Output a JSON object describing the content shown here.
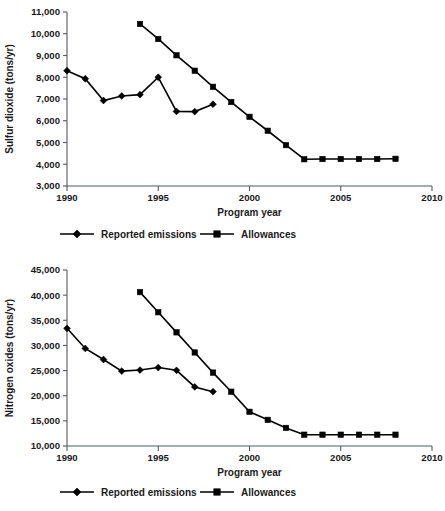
{
  "figure": {
    "background_color": "#ffffff",
    "ink_color": "#000000",
    "axis_color": "#555a5e"
  },
  "charts": [
    {
      "id": "sulfur-dioxide",
      "ylabel": "Sulfur dioxide (tons/yr)",
      "xlabel": "Program year",
      "legend": [
        {
          "label": "Reported emissions",
          "marker": "diamond"
        },
        {
          "label": "Allowances",
          "marker": "square"
        }
      ]
    },
    {
      "id": "nitrogen-oxides",
      "ylabel": "Nitrogen oxides (tons/yr)",
      "xlabel": "Program year",
      "legend": [
        {
          "label": "Reported emissions",
          "marker": "diamond"
        },
        {
          "label": "Allowances",
          "marker": "square"
        }
      ]
    }
  ],
  "chart_data": [
    {
      "type": "line",
      "id": "sulfur-dioxide",
      "title": "",
      "xlabel": "Program year",
      "ylabel": "Sulfur dioxide (tons/yr)",
      "xlim": [
        1990,
        2010
      ],
      "ylim": [
        3000,
        11000
      ],
      "xticks": [
        1990,
        1995,
        2000,
        2005,
        2010
      ],
      "xtick_labels": [
        "1990",
        "1995",
        "2000",
        "2005",
        "2010"
      ],
      "yticks": [
        3000,
        4000,
        5000,
        6000,
        7000,
        8000,
        9000,
        10000,
        11000
      ],
      "ytick_labels": [
        "3,000",
        "4,000",
        "5,000",
        "6,000",
        "7,000",
        "8,000",
        "9,000",
        "10,000",
        "11,000"
      ],
      "grid": false,
      "legend_position": "below",
      "series": [
        {
          "name": "Reported emissions",
          "marker": "diamond",
          "x": [
            1990,
            1991,
            1992,
            1993,
            1994,
            1995,
            1996,
            1997,
            1998
          ],
          "values": [
            8300,
            7930,
            6930,
            7140,
            7200,
            8000,
            6430,
            6420,
            6760
          ]
        },
        {
          "name": "Allowances",
          "marker": "square",
          "x": [
            1994,
            1995,
            1996,
            1997,
            1998,
            1999,
            2000,
            2001,
            2002,
            2003,
            2004,
            2005,
            2006,
            2007,
            2008
          ],
          "values": [
            10450,
            9760,
            9010,
            8300,
            7560,
            6860,
            6180,
            5540,
            4880,
            4230,
            4240,
            4240,
            4240,
            4240,
            4250
          ]
        }
      ]
    },
    {
      "type": "line",
      "id": "nitrogen-oxides",
      "title": "",
      "xlabel": "Program year",
      "ylabel": "Nitrogen oxides (tons/yr)",
      "xlim": [
        1990,
        2010
      ],
      "ylim": [
        10000,
        45000
      ],
      "xticks": [
        1990,
        1995,
        2000,
        2005,
        2010
      ],
      "xtick_labels": [
        "1990",
        "1995",
        "2000",
        "2005",
        "2010"
      ],
      "yticks": [
        10000,
        15000,
        20000,
        25000,
        30000,
        35000,
        40000,
        45000
      ],
      "ytick_labels": [
        "10,000",
        "15,000",
        "20,000",
        "25,000",
        "30,000",
        "35,000",
        "40,000",
        "45,000"
      ],
      "grid": false,
      "legend_position": "below",
      "series": [
        {
          "name": "Reported emissions",
          "marker": "diamond",
          "x": [
            1990,
            1991,
            1992,
            1993,
            1994,
            1995,
            1996,
            1997,
            1998
          ],
          "values": [
            33400,
            29400,
            27200,
            24900,
            25100,
            25600,
            25050,
            21750,
            20800
          ]
        },
        {
          "name": "Allowances",
          "marker": "square",
          "x": [
            1994,
            1995,
            1996,
            1997,
            1998,
            1999,
            2000,
            2001,
            2002,
            2003,
            2004,
            2005,
            2006,
            2007,
            2008
          ],
          "values": [
            40600,
            36600,
            32600,
            28600,
            24600,
            20800,
            16800,
            15200,
            13600,
            12250,
            12250,
            12250,
            12250,
            12250,
            12250
          ]
        }
      ]
    }
  ]
}
